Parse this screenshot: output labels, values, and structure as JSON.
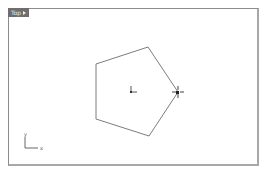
{
  "viewport": {
    "title": "Top",
    "menu_icon": "triangle-right-icon"
  },
  "axes": {
    "x_label": "x",
    "y_label": "y"
  },
  "shape": {
    "type": "pentagon",
    "stroke": "#7a7a7a"
  }
}
